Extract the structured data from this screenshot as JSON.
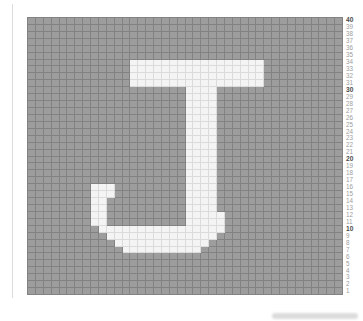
{
  "canvas": {
    "width": 363,
    "height": 321,
    "background": "#ffffff"
  },
  "colors": {
    "cell_gray": "#9d9d9d",
    "cell_white": "#f4f4f4",
    "grid_line_dark": "#828282",
    "grid_line_light": "#dbdbdb",
    "label_regular": "#9c9c9c",
    "label_bold": "#4a4a4a",
    "artifact": "#dcdcdc",
    "page_background": "#ffffff"
  },
  "grid_geometry": {
    "left": 27,
    "top": 17,
    "width": 316,
    "height": 278,
    "label_column_x": 346
  },
  "artifacts": {
    "left_edge_line": {
      "x": 12,
      "y": 4,
      "width": 1,
      "height": 294
    },
    "bottom_right_smudge": {
      "x": 272,
      "y": 313,
      "width": 86,
      "height": 6
    }
  },
  "chart_data": {
    "type": "heatmap",
    "title": "",
    "glyph": "J",
    "rows": 40,
    "cols": 40,
    "legend_position": "none",
    "grid_on": true,
    "row_tick_labels": [
      "40",
      "39",
      "38",
      "37",
      "36",
      "35",
      "34",
      "33",
      "32",
      "31",
      "30",
      "29",
      "28",
      "27",
      "26",
      "25",
      "24",
      "23",
      "22",
      "21",
      "20",
      "19",
      "18",
      "17",
      "16",
      "15",
      "14",
      "13",
      "12",
      "11",
      "10",
      "9",
      "8",
      "7",
      "6",
      "5",
      "4",
      "3",
      "2",
      "1"
    ],
    "bold_row_numbers": [
      40,
      30,
      20,
      10
    ],
    "filled_cell_runs_by_row": {
      "7": [
        [
          13,
          22
        ]
      ],
      "8": [
        [
          12,
          23
        ]
      ],
      "9": [
        [
          11,
          24
        ]
      ],
      "10": [
        [
          10,
          25
        ]
      ],
      "11": [
        [
          9,
          10
        ],
        [
          21,
          25
        ]
      ],
      "12": [
        [
          9,
          10
        ],
        [
          21,
          25
        ]
      ],
      "13": [
        [
          9,
          10
        ],
        [
          21,
          24
        ]
      ],
      "14": [
        [
          9,
          10
        ],
        [
          21,
          24
        ]
      ],
      "15": [
        [
          9,
          11
        ],
        [
          21,
          24
        ]
      ],
      "16": [
        [
          9,
          11
        ],
        [
          21,
          24
        ]
      ],
      "17": [
        [
          21,
          24
        ]
      ],
      "18": [
        [
          21,
          24
        ]
      ],
      "19": [
        [
          21,
          24
        ]
      ],
      "20": [
        [
          21,
          24
        ]
      ],
      "21": [
        [
          21,
          24
        ]
      ],
      "22": [
        [
          21,
          24
        ]
      ],
      "23": [
        [
          21,
          24
        ]
      ],
      "24": [
        [
          21,
          24
        ]
      ],
      "25": [
        [
          21,
          24
        ]
      ],
      "26": [
        [
          21,
          24
        ]
      ],
      "27": [
        [
          21,
          24
        ]
      ],
      "28": [
        [
          21,
          24
        ]
      ],
      "29": [
        [
          21,
          24
        ]
      ],
      "30": [
        [
          21,
          24
        ]
      ],
      "31": [
        [
          14,
          30
        ]
      ],
      "32": [
        [
          14,
          30
        ]
      ],
      "33": [
        [
          14,
          30
        ]
      ],
      "34": [
        [
          14,
          30
        ]
      ]
    }
  }
}
